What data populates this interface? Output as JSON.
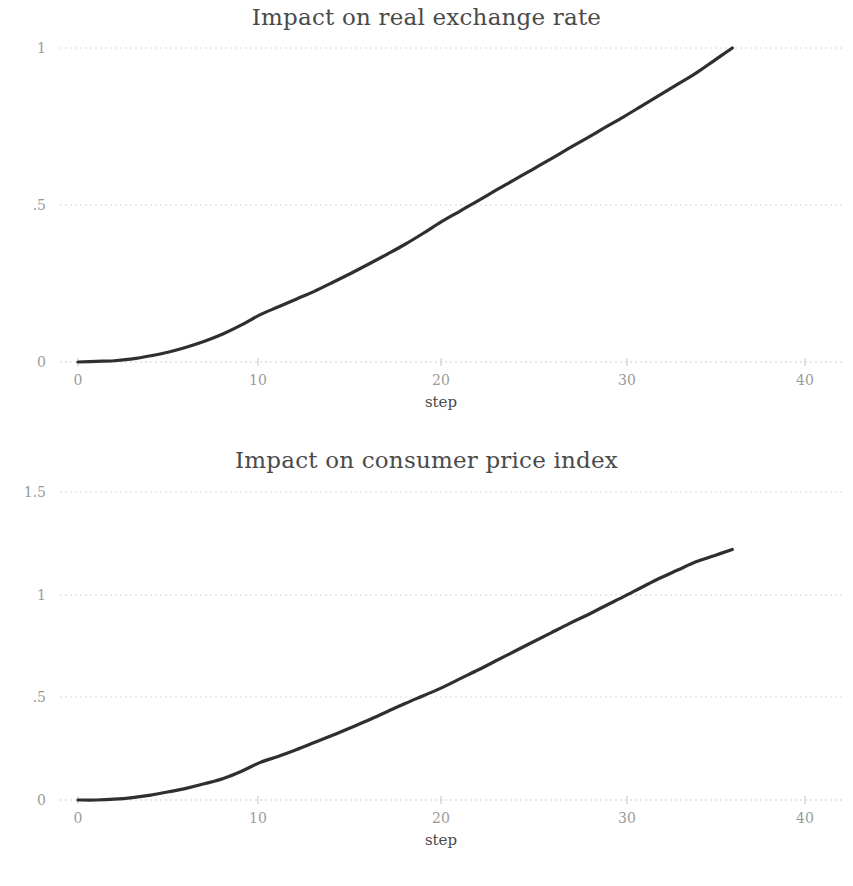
{
  "figure": {
    "background_color": "#ffffff",
    "line_color": "#2f2f2f",
    "grid_color": "#d8d8d8",
    "tick_label_color": "#9a9a9a",
    "title_color": "#4a4a4a"
  },
  "panels": [
    {
      "id": "real-exchange-rate",
      "title": "Impact on real exchange rate",
      "xlabel": "step",
      "ytick_labels": [
        "0",
        ".5",
        "1"
      ],
      "xtick_labels": [
        "0",
        "10",
        "20",
        "30",
        "40"
      ]
    },
    {
      "id": "consumer-price-index",
      "title": "Impact on consumer price index",
      "xlabel": "step",
      "ytick_labels": [
        "0",
        ".5",
        "1",
        "1.5"
      ],
      "xtick_labels": [
        "0",
        "10",
        "20",
        "30",
        "40"
      ]
    }
  ],
  "chart_data": [
    {
      "type": "line",
      "title": "Impact on real exchange rate",
      "xlabel": "step",
      "ylabel": "",
      "xlim": [
        -1.5,
        42
      ],
      "ylim": [
        0,
        1
      ],
      "xticks": [
        0,
        10,
        20,
        30,
        40
      ],
      "yticks": [
        0,
        0.5,
        1
      ],
      "grid": true,
      "legend": "none",
      "series": [
        {
          "name": "Impact on real exchange rate",
          "x": [
            0,
            1,
            2,
            3,
            4,
            5,
            6,
            7,
            8,
            9,
            10,
            11,
            12,
            13,
            14,
            15,
            16,
            17,
            18,
            19,
            20,
            21,
            22,
            23,
            24,
            25,
            26,
            27,
            28,
            29,
            30,
            31,
            32,
            33,
            34,
            35,
            36
          ],
          "values": [
            0.0,
            0.002,
            0.004,
            0.01,
            0.02,
            0.032,
            0.048,
            0.067,
            0.09,
            0.118,
            0.15,
            0.175,
            0.2,
            0.225,
            0.253,
            0.282,
            0.312,
            0.343,
            0.375,
            0.41,
            0.447,
            0.48,
            0.513,
            0.547,
            0.58,
            0.613,
            0.646,
            0.68,
            0.713,
            0.747,
            0.78,
            0.815,
            0.85,
            0.885,
            0.92,
            0.96,
            1.0
          ]
        }
      ]
    },
    {
      "type": "line",
      "title": "Impact on consumer price index",
      "xlabel": "step",
      "ylabel": "",
      "xlim": [
        -1.5,
        42
      ],
      "ylim": [
        0,
        1.5
      ],
      "xticks": [
        0,
        10,
        20,
        30,
        40
      ],
      "yticks": [
        0,
        0.5,
        1,
        1.5
      ],
      "grid": true,
      "legend": "none",
      "series": [
        {
          "name": "Impact on consumer price index",
          "x": [
            0,
            1,
            2,
            3,
            4,
            5,
            6,
            7,
            8,
            9,
            10,
            11,
            12,
            13,
            14,
            15,
            16,
            17,
            18,
            19,
            20,
            21,
            22,
            23,
            24,
            25,
            26,
            27,
            28,
            29,
            30,
            31,
            32,
            33,
            34,
            35,
            36
          ],
          "values": [
            0.0,
            0.0,
            0.004,
            0.012,
            0.024,
            0.04,
            0.058,
            0.08,
            0.105,
            0.14,
            0.182,
            0.212,
            0.245,
            0.28,
            0.315,
            0.352,
            0.39,
            0.43,
            0.47,
            0.508,
            0.546,
            0.59,
            0.633,
            0.678,
            0.723,
            0.768,
            0.813,
            0.858,
            0.9,
            0.945,
            0.989,
            1.035,
            1.08,
            1.12,
            1.16,
            1.19,
            1.22
          ]
        }
      ]
    }
  ],
  "geometry": {
    "panel_width": 853,
    "panel_height": 443,
    "x_px_at_0": 78,
    "x_px_at_40": 805,
    "panel1_y_px_at_0": 362,
    "panel1_y_px_at_1": 48,
    "panel2_y_px_at_0": 357,
    "panel2_y_px_at_1_5": 49,
    "axis_left_px": 60,
    "axis_right_px": 845
  }
}
